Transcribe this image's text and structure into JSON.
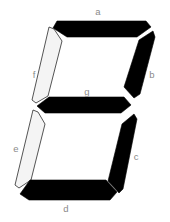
{
  "diagram": {
    "colors": {
      "on": "#000000",
      "off": "#f4f4f4",
      "outline": "#2a2a2a",
      "label": "#8a8a8a",
      "background": "#ffffff"
    },
    "segments": [
      {
        "id": "a",
        "label": "a",
        "state": "on"
      },
      {
        "id": "b",
        "label": "b",
        "state": "on"
      },
      {
        "id": "c",
        "label": "c",
        "state": "on"
      },
      {
        "id": "d",
        "label": "d",
        "state": "on"
      },
      {
        "id": "e",
        "label": "e",
        "state": "off"
      },
      {
        "id": "f",
        "label": "f",
        "state": "off"
      },
      {
        "id": "g",
        "label": "g",
        "state": "on"
      }
    ]
  }
}
